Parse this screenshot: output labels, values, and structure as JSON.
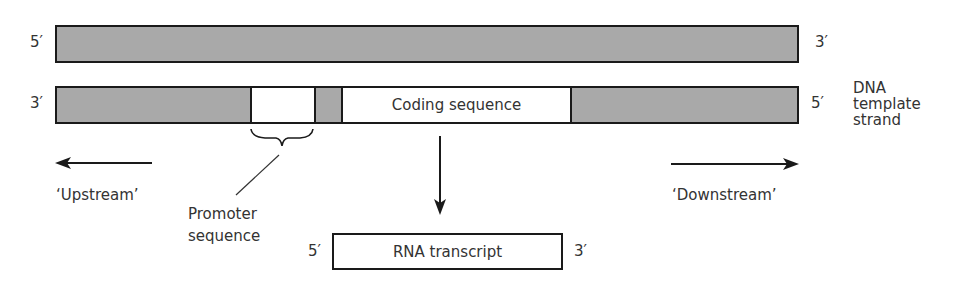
{
  "diagram": {
    "type": "dna-transcription",
    "top_strand": {
      "left_end": "5′",
      "right_end": "3′"
    },
    "template_strand": {
      "left_end": "3′",
      "right_end": "5′",
      "label_lines": [
        "DNA",
        "template",
        "strand"
      ],
      "promoter_region": {
        "label_lines": [
          "Promoter",
          "sequence"
        ]
      },
      "coding_region": {
        "label": "Coding sequence"
      }
    },
    "directions": {
      "upstream": "‘Upstream’",
      "downstream": "‘Downstream’"
    },
    "rna": {
      "label": "RNA transcript",
      "left_end": "5′",
      "right_end": "3′"
    },
    "colors": {
      "strand_fill": "#a9a9a9",
      "outline": "#1a1a1a",
      "region_fill": "#ffffff"
    }
  }
}
